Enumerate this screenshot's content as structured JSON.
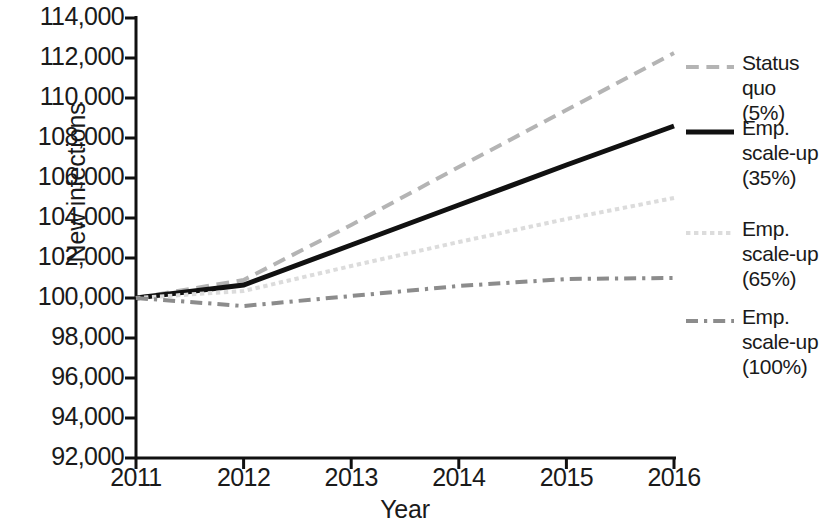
{
  "chart_data": {
    "type": "line",
    "title": "",
    "xlabel": "Year",
    "ylabel": "New infections",
    "x": [
      2011,
      2012,
      2013,
      2014,
      2015,
      2016
    ],
    "xtick_labels": [
      "2011",
      "2012",
      "2013",
      "2014",
      "2015",
      "2016"
    ],
    "xlim": [
      2011,
      2016
    ],
    "ylim": [
      92000,
      114000
    ],
    "ytick_labels": [
      "114,000",
      "112,000",
      "110.000",
      "108,000",
      "106,000",
      "104,000",
      "102,000",
      "100,000",
      "98,000",
      "96,000",
      "94,000",
      "92,000"
    ],
    "ytick_values": [
      114000,
      112000,
      110000,
      108000,
      106000,
      104000,
      102000,
      100000,
      98000,
      96000,
      94000,
      92000
    ],
    "grid": false,
    "legend_position": "right",
    "series": [
      {
        "name": "Status quo (5%)",
        "label_lines": [
          "Status",
          "quo (5%)"
        ],
        "style": "dashed",
        "color": "#b4b4b4",
        "width": 4,
        "values": [
          100000,
          100900,
          103650,
          106550,
          109400,
          112250
        ]
      },
      {
        "name": "Emp. scale-up (35%)",
        "label_lines": [
          "Emp.",
          "scale-up",
          "(35%)"
        ],
        "style": "solid",
        "color": "#111111",
        "width": 5,
        "values": [
          100000,
          100650,
          102650,
          104650,
          106650,
          108600
        ]
      },
      {
        "name": "Emp. scale-up (65%)",
        "label_lines": [
          "Emp.",
          "scale-up",
          "(65%)"
        ],
        "style": "dotted",
        "color": "#dcdcdc",
        "width": 4,
        "values": [
          100000,
          100350,
          101600,
          102800,
          103950,
          105000
        ]
      },
      {
        "name": "Emp. scale-up (100%)",
        "label_lines": [
          "Emp.",
          "scale-up",
          "(100%)"
        ],
        "style": "dashdot",
        "color": "#8c8c8c",
        "width": 4,
        "values": [
          100000,
          99600,
          100100,
          100600,
          100950,
          101000
        ]
      }
    ]
  },
  "axes": {
    "y_title": "New infections",
    "x_title": "Year"
  }
}
